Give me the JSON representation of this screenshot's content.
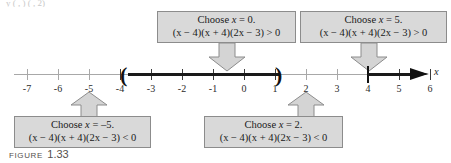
{
  "figure": {
    "caption_word": "FIGURE",
    "caption_number": "1.33",
    "top_clipped_text": "y  ( , )   ( ,  2)"
  },
  "axis": {
    "variable_label": "x",
    "tick_labels": [
      "-7",
      "-6",
      "-5",
      "-4",
      "-3",
      "-2",
      "-1",
      "0",
      "1",
      "2",
      "3",
      "4",
      "5",
      "6"
    ],
    "tick_values": [
      -7,
      -6,
      -5,
      -4,
      -3,
      -2,
      -1,
      0,
      1,
      2,
      3,
      4,
      5,
      6
    ],
    "min": -7.6,
    "max": 6.8,
    "arrow_direction": "right",
    "intervals": [
      {
        "name": "interval-neg4-to-1point5",
        "start": -4,
        "end": 1.5,
        "start_endpoint": "open",
        "end_endpoint": "open",
        "start_symbol": "(",
        "end_symbol": ")",
        "shaded": true
      },
      {
        "name": "interval-4-to-infinity",
        "start": 4,
        "end": 6.8,
        "start_endpoint": "bar",
        "end_endpoint": "arrow",
        "shaded": true
      }
    ]
  },
  "callouts": [
    {
      "id": "callout-x-equals-0",
      "position": "above",
      "target_value": 0,
      "line1_pre": "Choose ",
      "line1_var": "x",
      "line1_post": " = 0.",
      "line2": "(x − 4)(x + 4)(2x − 3) > 0",
      "sign": ">",
      "conclusion": "positive"
    },
    {
      "id": "callout-x-equals-5",
      "position": "above",
      "target_value": 5,
      "line1_pre": "Choose ",
      "line1_var": "x",
      "line1_post": " = 5.",
      "line2": "(x − 4)(x + 4)(2x − 3) > 0",
      "sign": ">",
      "conclusion": "positive"
    },
    {
      "id": "callout-x-equals-minus-5",
      "position": "below",
      "target_value": -5,
      "line1_pre": "Choose ",
      "line1_var": "x",
      "line1_post": " = –5.",
      "line2": "(x − 4)(x + 4)(2x − 3) < 0",
      "sign": "<",
      "conclusion": "negative"
    },
    {
      "id": "callout-x-equals-2",
      "position": "below",
      "target_value": 2,
      "line1_pre": "Choose ",
      "line1_var": "x",
      "line1_post": " = 2.",
      "line2": "(x − 4)(x + 4)(2x − 3) < 0",
      "sign": "<",
      "conclusion": "negative"
    }
  ],
  "colors": {
    "box_fill": "#d9d9d9",
    "box_border": "#8c8c8c",
    "arrow_fill": "#d4d4d4",
    "arrow_border": "#8c8c8c",
    "axis_thin": "#a8a8a8",
    "axis_thick": "#1a1a1a",
    "text": "#1a1a1a",
    "caption": "#55504d"
  }
}
